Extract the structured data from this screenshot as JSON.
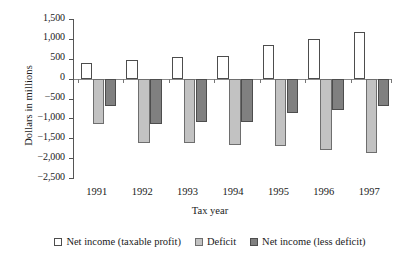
{
  "chart_data": {
    "type": "bar",
    "title": "",
    "xlabel": "Tax year",
    "ylabel": "Dollars in millions",
    "categories": [
      "1991",
      "1992",
      "1993",
      "1994",
      "1995",
      "1996",
      "1997"
    ],
    "ylim": [
      -2500,
      1500
    ],
    "yticks": [
      1500,
      1000,
      500,
      0,
      -500,
      -1000,
      -1500,
      -2000,
      -2500
    ],
    "ytick_labels": [
      "1,500",
      "1,000",
      "500",
      "0",
      "−500",
      "−1,000",
      "−1,500",
      "−2,000",
      "−2,500"
    ],
    "grid": false,
    "legend_position": "bottom",
    "series": [
      {
        "name": "Net income (taxable profit)",
        "color": "#ffffff",
        "values": [
          400,
          480,
          540,
          580,
          840,
          1000,
          1180
        ]
      },
      {
        "name": "Deficit",
        "color": "#c2c2c2",
        "values": [
          -1130,
          -1620,
          -1620,
          -1680,
          -1700,
          -1800,
          -1880
        ]
      },
      {
        "name": "Net income (less deficit)",
        "color": "#808080",
        "values": [
          -700,
          -1130,
          -1080,
          -1100,
          -870,
          -800,
          -700
        ]
      }
    ]
  }
}
